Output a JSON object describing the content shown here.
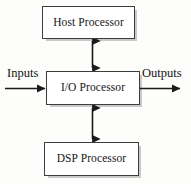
{
  "diagram": {
    "background_color": "#fdfdfb",
    "box_fill_color": "#ffffff",
    "box_border_color": "#3d3d3d",
    "shadow_color": "#c9c9c9",
    "connector_color": "#1a1a1a",
    "nodes": [
      {
        "id": "host",
        "label": "Host Processor"
      },
      {
        "id": "io",
        "label": "I/O Processor"
      },
      {
        "id": "dsp",
        "label": "DSP Processor"
      }
    ],
    "labels": {
      "inputs": "Inputs",
      "outputs": "Outputs"
    },
    "connectors": [
      {
        "id": "host-io",
        "style": "double-headed-vertical-arrow"
      },
      {
        "id": "io-dsp",
        "style": "double-headed-vertical-arrow"
      },
      {
        "id": "input-flow",
        "style": "single-headed-horizontal-arrow"
      },
      {
        "id": "output-flow",
        "style": "single-headed-horizontal-arrow"
      }
    ]
  }
}
